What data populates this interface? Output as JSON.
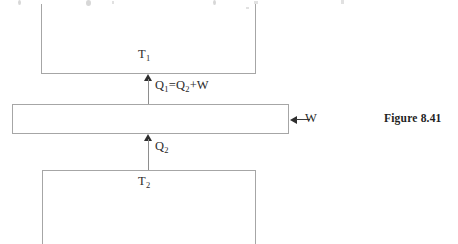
{
  "figure": {
    "caption": "Figure 8.41",
    "type": "thermodynamic-heat-engine-diagram",
    "background_color": "#ffffff",
    "line_color": "#a6a6a6",
    "arrow_color": "#2e2e2e",
    "text_color": "#2b2b2b"
  },
  "hot_reservoir": {
    "label_main": "T",
    "label_sub": "1"
  },
  "cold_reservoir": {
    "label_main": "T",
    "label_sub": "2"
  },
  "engine": {
    "label": ""
  },
  "heat_in": {
    "label_q": "Q",
    "label_q_sub": "1",
    "label_equals": "=Q",
    "label_q2_sub": "2",
    "label_plus_w": "+W",
    "full_text": "Q1=Q2+W",
    "direction": "up"
  },
  "heat_out": {
    "label_q": "Q",
    "label_q_sub": "2",
    "full_text": "Q2",
    "direction": "up"
  },
  "work": {
    "label": "W",
    "direction": "left"
  }
}
